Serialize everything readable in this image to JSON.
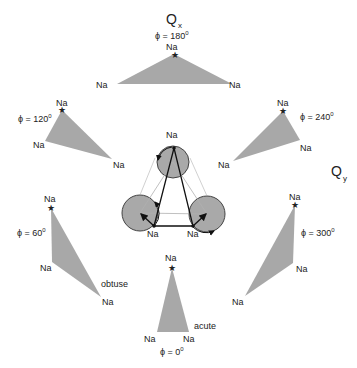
{
  "axes": {
    "qx": {
      "main": "Q",
      "sub": "x"
    },
    "qy": {
      "main": "Q",
      "sub": "y"
    }
  },
  "atom_label": "Na",
  "marker_icon": "star",
  "triangles": [
    {
      "phi": "ϕ = 180",
      "deg": "0",
      "points": "174,54 117,84 232,84"
    },
    {
      "phi": "ϕ = 120",
      "deg": "0",
      "points": "62,110 45,141 112,159"
    },
    {
      "phi": "ϕ = 240",
      "deg": "0",
      "points": "283,111 300,140 233,161"
    },
    {
      "phi": "ϕ = 60",
      "deg": "0",
      "points": "51,208 52,262 101,297"
    },
    {
      "phi": "ϕ = 0",
      "deg": "0",
      "points": "172,268 157,332 189,332"
    },
    {
      "phi": "ϕ = 300",
      "deg": "0",
      "points": "295,205 293,263 245,296"
    }
  ],
  "annotations": {
    "obtuse": "obtuse",
    "acute": "acute"
  },
  "colors": {
    "triangle_fill": "#a8a8a8",
    "circle_fill": "#a9a9a9",
    "line": "#111111",
    "thin_line": "#b0b0b0"
  }
}
